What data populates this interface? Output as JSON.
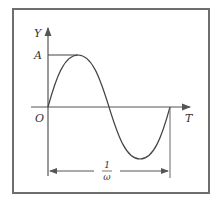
{
  "diagram": {
    "type": "sine-wave-plot",
    "axes": {
      "y_label": "Y",
      "x_label": "T",
      "origin_label": "O",
      "amplitude_label": "A"
    },
    "dimension": {
      "label_numerator": "1",
      "label_denominator": "ω",
      "description": "period spanning one full cycle"
    },
    "colors": {
      "line": "#333333",
      "frame": "#6e6e6e",
      "background": "#ffffff"
    }
  }
}
